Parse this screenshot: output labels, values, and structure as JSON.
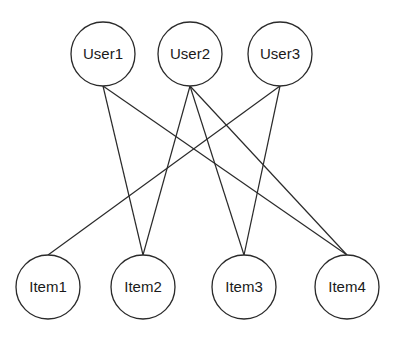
{
  "diagram": {
    "type": "bipartite-graph",
    "user_nodes": [
      {
        "id": "User1",
        "label": "User1"
      },
      {
        "id": "User2",
        "label": "User2"
      },
      {
        "id": "User3",
        "label": "User3"
      }
    ],
    "item_nodes": [
      {
        "id": "Item1",
        "label": "Item1"
      },
      {
        "id": "Item2",
        "label": "Item2"
      },
      {
        "id": "Item3",
        "label": "Item3"
      },
      {
        "id": "Item4",
        "label": "Item4"
      }
    ],
    "edges": [
      {
        "from": "User1",
        "to": "Item2"
      },
      {
        "from": "User1",
        "to": "Item4"
      },
      {
        "from": "User2",
        "to": "Item2"
      },
      {
        "from": "User2",
        "to": "Item3"
      },
      {
        "from": "User2",
        "to": "Item4"
      },
      {
        "from": "User3",
        "to": "Item1"
      },
      {
        "from": "User3",
        "to": "Item3"
      }
    ]
  }
}
